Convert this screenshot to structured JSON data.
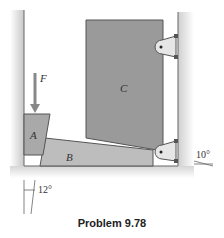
{
  "figure": {
    "caption": "Problem 9.78",
    "labels": {
      "force": "F",
      "block_a": "A",
      "block_b": "B",
      "block_c": "C",
      "angle_right": "10°",
      "angle_left": "12°"
    },
    "colors": {
      "block_fill": "#a9a9a9",
      "block_c_fill": "#9a9a9a",
      "block_b_fill": "#bdbdbd",
      "outline": "#555555",
      "wall": "#d4d4d4"
    }
  }
}
